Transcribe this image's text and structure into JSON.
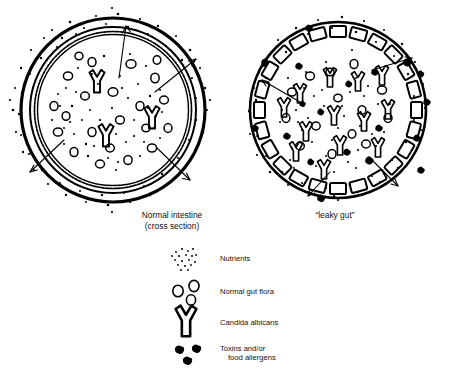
{
  "figure": {
    "title_visible": false,
    "background_color": "#ffffff",
    "ink_color": "#000000",
    "panels": [
      {
        "id": "normal-intestine",
        "caption_line1": "Normal intestine",
        "caption_line2": "(cross section)",
        "caption_x": 172,
        "caption_y": 218,
        "center_x": 113,
        "center_y": 110,
        "radius_outer": 95,
        "wall_type": "intact-continuous",
        "wall_description": "thick unbroken outer ring with wavy inner mucosal lining",
        "contents": {
          "candida_count": 3,
          "flora_count": 22,
          "nutrient_dots_inside": 45,
          "toxin_blobs_inside": 0,
          "nutrient_dots_outside": 60,
          "toxin_blobs_outside": 0
        },
        "arrows_outward": 4
      },
      {
        "id": "leaky-gut",
        "caption_line1": "“leaky gut”",
        "caption_line2": "",
        "caption_x": 335,
        "caption_y": 218,
        "center_x": 338,
        "center_y": 110,
        "radius_outer": 88,
        "wall_type": "broken-gapped",
        "wall_description": "thin outer ring with separated rectangular cells leaving gaps",
        "contents": {
          "candida_count": 13,
          "flora_count": 14,
          "nutrient_dots_inside": 40,
          "toxin_blobs_inside": 10,
          "nutrient_dots_outside": 45,
          "toxin_blobs_outside": 9
        },
        "arrows_outward": 4
      }
    ]
  },
  "legend": {
    "x": 175,
    "y": 252,
    "items": [
      {
        "icon": "nutrient-dots-icon",
        "label_line1": "Nutrients",
        "label_line2": ""
      },
      {
        "icon": "gut-flora-circles-icon",
        "label_line1": "Normal gut flora",
        "label_line2": ""
      },
      {
        "icon": "candida-y-icon",
        "label_line1": "Candida albicans",
        "label_line2": ""
      },
      {
        "icon": "toxin-blobs-icon",
        "label_line1": "Toxins and/or",
        "label_line2": "food allergens"
      }
    ]
  }
}
